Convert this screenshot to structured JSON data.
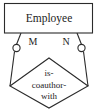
{
  "diagram": {
    "kind": "er-diagram",
    "title_text": "",
    "colors": {
      "background": "#ffffff",
      "stroke": "#2b2b2b",
      "fill": "#ffffff",
      "text": "#1c1c1c"
    },
    "entity": {
      "name": "Employee",
      "label": "Employee"
    },
    "relationship": {
      "name": "is-coauthor-with",
      "line1": "is-",
      "line2": "coauthor-",
      "line3": "with"
    },
    "cardinalities": {
      "left": "M",
      "right": "N"
    },
    "role_markers": {
      "left": "role-circle-left",
      "right": "role-circle-right"
    }
  }
}
